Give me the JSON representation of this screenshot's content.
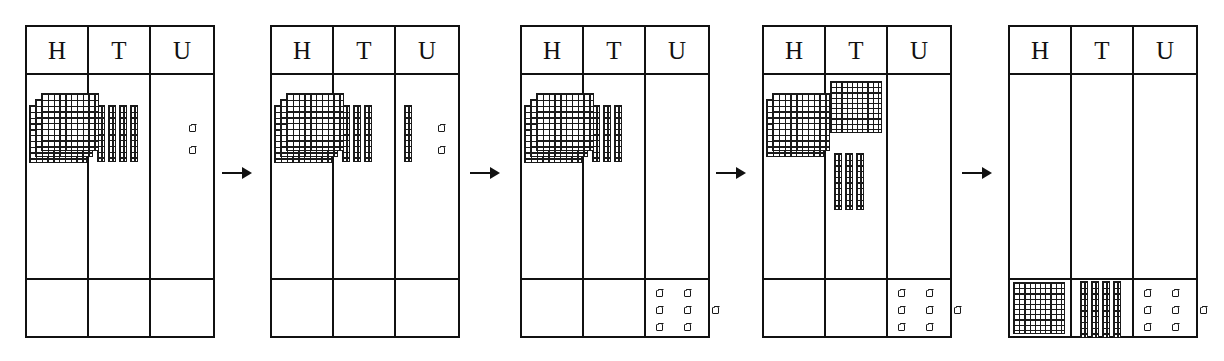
{
  "diagram": {
    "column_headers": [
      "H",
      "T",
      "U"
    ],
    "header_names": [
      "Hundreds",
      "Tens",
      "Units"
    ],
    "arrow_glyph": "→",
    "arrow_count": 4,
    "ink_color": "#111111",
    "block_color": "#1a1a1a",
    "background": "#ffffff"
  },
  "panels": [
    {
      "index": 1,
      "name": "panel-1",
      "headers": [
        "H",
        "T",
        "U"
      ],
      "work_row": {
        "H": {
          "flats": 3,
          "rods": 0,
          "cubes": 0
        },
        "T": {
          "flats": 0,
          "rods": 4,
          "cubes": 0
        },
        "U": {
          "flats": 0,
          "rods": 0,
          "cubes": 2
        }
      },
      "answer_row": {
        "H": {
          "flats": 0,
          "rods": 0,
          "cubes": 0
        },
        "T": {
          "flats": 0,
          "rods": 0,
          "cubes": 0
        },
        "U": {
          "flats": 0,
          "rods": 0,
          "cubes": 0
        }
      },
      "value": "342"
    },
    {
      "index": 2,
      "name": "panel-2",
      "headers": [
        "H",
        "T",
        "U"
      ],
      "work_row": {
        "H": {
          "flats": 3,
          "rods": 0,
          "cubes": 0
        },
        "T": {
          "flats": 0,
          "rods": 3,
          "cubes": 0
        },
        "U": {
          "flats": 0,
          "rods": 1,
          "cubes": 2
        }
      },
      "answer_row": {
        "H": {
          "flats": 0,
          "rods": 0,
          "cubes": 0
        },
        "T": {
          "flats": 0,
          "rods": 0,
          "cubes": 0
        },
        "U": {
          "flats": 0,
          "rods": 0,
          "cubes": 0
        }
      },
      "value": "342"
    },
    {
      "index": 3,
      "name": "panel-3",
      "headers": [
        "H",
        "T",
        "U"
      ],
      "work_row": {
        "H": {
          "flats": 3,
          "rods": 0,
          "cubes": 0
        },
        "T": {
          "flats": 0,
          "rods": 3,
          "cubes": 0
        },
        "U": {
          "flats": 0,
          "rods": 0,
          "cubes": 0
        }
      },
      "answer_row": {
        "H": {
          "flats": 0,
          "rods": 0,
          "cubes": 0
        },
        "T": {
          "flats": 0,
          "rods": 0,
          "cubes": 0
        },
        "U": {
          "flats": 0,
          "rods": 0,
          "cubes": 7
        }
      },
      "value": "7"
    },
    {
      "index": 4,
      "name": "panel-4",
      "headers": [
        "H",
        "T",
        "U"
      ],
      "work_row": {
        "H": {
          "flats": 2,
          "rods": 0,
          "cubes": 0
        },
        "T": {
          "flats": 1,
          "rods": 3,
          "cubes": 0
        },
        "U": {
          "flats": 0,
          "rods": 0,
          "cubes": 0
        }
      },
      "answer_row": {
        "H": {
          "flats": 0,
          "rods": 0,
          "cubes": 0
        },
        "T": {
          "flats": 0,
          "rods": 0,
          "cubes": 0
        },
        "U": {
          "flats": 0,
          "rods": 0,
          "cubes": 7
        }
      },
      "value": "7"
    },
    {
      "index": 5,
      "name": "panel-5",
      "headers": [
        "H",
        "T",
        "U"
      ],
      "work_row": {
        "H": {
          "flats": 0,
          "rods": 0,
          "cubes": 0
        },
        "T": {
          "flats": 0,
          "rods": 0,
          "cubes": 0
        },
        "U": {
          "flats": 0,
          "rods": 0,
          "cubes": 0
        }
      },
      "answer_row": {
        "H": {
          "flats": 1,
          "rods": 0,
          "cubes": 0
        },
        "T": {
          "flats": 0,
          "rods": 4,
          "cubes": 0
        },
        "U": {
          "flats": 0,
          "rods": 0,
          "cubes": 7
        }
      },
      "value": "147"
    }
  ]
}
